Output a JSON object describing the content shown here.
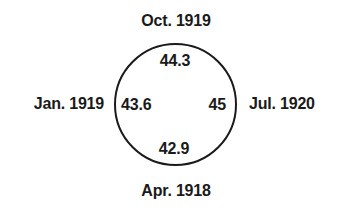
{
  "diagram": {
    "type": "cyclic-value-diagram",
    "shape": "circle",
    "nodes": [
      {
        "position": "top",
        "time_label": "Oct. 1919",
        "value": "44.3"
      },
      {
        "position": "right",
        "time_label": "Jul. 1920",
        "value": "45"
      },
      {
        "position": "bottom",
        "time_label": "Apr. 1918",
        "value": "42.9"
      },
      {
        "position": "left",
        "time_label": "Jan. 1919",
        "value": "43.6"
      }
    ],
    "colors": {
      "line": "#1a1a1a",
      "text": "#1a1a1a",
      "background": "#ffffff"
    }
  }
}
